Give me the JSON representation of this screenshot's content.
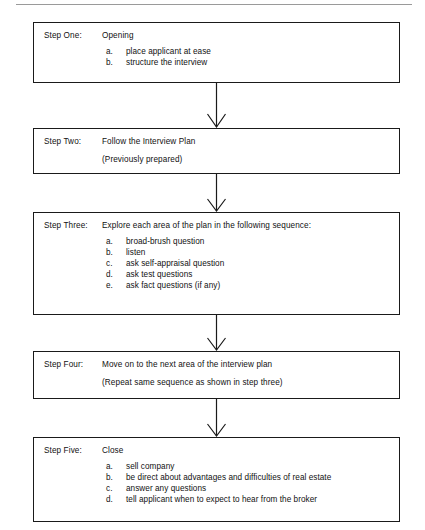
{
  "page": {
    "background_color": "#ffffff",
    "line_color": "#1a1a1a",
    "top_rule_color": "#9a9a9a"
  },
  "diagram": {
    "type": "flowchart",
    "orientation": "vertical",
    "connector": "down-arrow",
    "steps": [
      {
        "label": "Step One:",
        "heading": "Opening",
        "subheading": "",
        "items": [
          {
            "marker": "a.",
            "text": "place applicant at ease"
          },
          {
            "marker": "b.",
            "text": "structure the interview"
          }
        ]
      },
      {
        "label": "Step Two:",
        "heading": "Follow the Interview Plan",
        "subheading": "(Previously prepared)",
        "items": []
      },
      {
        "label": "Step Three:",
        "heading": "Explore each area of the plan in the following sequence:",
        "subheading": "",
        "items": [
          {
            "marker": "a.",
            "text": "broad-brush question"
          },
          {
            "marker": "b.",
            "text": "listen"
          },
          {
            "marker": "c.",
            "text": "ask self-appraisal question"
          },
          {
            "marker": "d.",
            "text": "ask test questions"
          },
          {
            "marker": "e.",
            "text": "ask fact questions (if any)"
          }
        ]
      },
      {
        "label": "Step Four:",
        "heading": "Move on to the next area of the interview plan",
        "subheading": "(Repeat same sequence as shown in step three)",
        "items": []
      },
      {
        "label": "Step Five:",
        "heading": "Close",
        "subheading": "",
        "items": [
          {
            "marker": "a.",
            "text": "sell company"
          },
          {
            "marker": "b.",
            "text": "be direct about advantages and difficulties of real estate"
          },
          {
            "marker": "c.",
            "text": "answer any questions"
          },
          {
            "marker": "d.",
            "text": "tell applicant when to expect to hear from the broker"
          }
        ]
      }
    ]
  }
}
